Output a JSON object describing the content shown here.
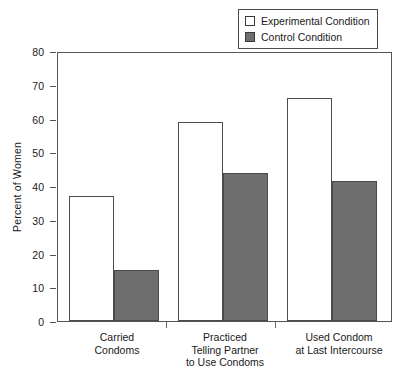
{
  "chart_data": {
    "type": "bar",
    "title": "",
    "xlabel": "",
    "ylabel": "Percent of Women",
    "ylim": [
      0,
      80
    ],
    "ytick_values": [
      0,
      10,
      20,
      30,
      40,
      50,
      60,
      70,
      80
    ],
    "ytick_labels": [
      "0",
      "10",
      "20",
      "30",
      "40",
      "50",
      "60",
      "70",
      "80"
    ],
    "grid": false,
    "legend_position": "top-right",
    "categories": [
      "Carried\nCondoms",
      "Practiced\nTelling Partner\nto Use Condoms",
      "Used Condom\nat Last Intercourse"
    ],
    "category_lines": [
      [
        "Carried",
        "Condoms"
      ],
      [
        "Practiced",
        "Telling Partner",
        "to Use Condoms"
      ],
      [
        "Used Condom",
        "at Last Intercourse"
      ]
    ],
    "series": [
      {
        "name": "Experimental Condition",
        "values": [
          37,
          59,
          66
        ],
        "color": "#ffffff",
        "edge": "#4d4d4d"
      },
      {
        "name": "Control Condition",
        "values": [
          15,
          44,
          41.5
        ],
        "color": "#6e6e6e",
        "edge": "#4a4a4a"
      }
    ]
  },
  "legend": {
    "items": [
      {
        "label": "Experimental Condition",
        "swatch": "white"
      },
      {
        "label": "Control Condition",
        "swatch": "gray"
      }
    ]
  },
  "axis": {
    "y_title": "Percent of Women"
  },
  "colors": {
    "experimental_fill": "#ffffff",
    "control_fill": "#6e6e6e",
    "axis_line": "#555555",
    "text": "#1a1a1a"
  }
}
